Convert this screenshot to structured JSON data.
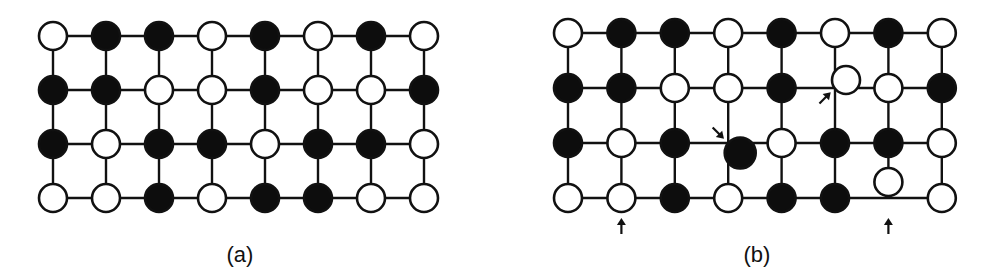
{
  "figure": {
    "colors": {
      "black_node": "#0d0d0d",
      "white_node": "#ffffff",
      "stroke": "#111111"
    },
    "panels": [
      {
        "id": "a",
        "label": "(a)",
        "rows": [
          [
            "W",
            "B",
            "B",
            "W",
            "B",
            "W",
            "B",
            "W"
          ],
          [
            "B",
            "B",
            "W",
            "W",
            "B",
            "W",
            "W",
            "B"
          ],
          [
            "B",
            "W",
            "B",
            "B",
            "W",
            "B",
            "B",
            "W"
          ],
          [
            "W",
            "W",
            "B",
            "W",
            "B",
            "B",
            "W",
            "W"
          ]
        ],
        "defects": [],
        "arrows": []
      },
      {
        "id": "b",
        "label": "(b)",
        "rows": [
          [
            "W",
            "B",
            "B",
            "W",
            "B",
            "W",
            "B",
            "W"
          ],
          [
            "B",
            "B",
            "W",
            "W",
            "B",
            "W",
            "W",
            "B"
          ],
          [
            "B",
            "W",
            "B",
            "B",
            "W",
            "B",
            "B",
            "W"
          ],
          [
            "W",
            "W",
            "B",
            "W",
            "B",
            "B",
            "W",
            "W"
          ]
        ],
        "defects": [
          {
            "row": 1,
            "col": 5,
            "shift": "up-right",
            "description": "displaced white node"
          },
          {
            "row": 2,
            "col": 3,
            "shift": "down-right",
            "description": "displaced black node"
          },
          {
            "row": 3,
            "col": 6,
            "shift": "up",
            "description": "displaced white node"
          }
        ],
        "arrows": [
          {
            "target_row": 3,
            "target_col": 1,
            "direction": "up"
          },
          {
            "target_row": 2,
            "target_col": 3,
            "direction": "down-right"
          },
          {
            "target_row": 1,
            "target_col": 5,
            "direction": "up-right"
          },
          {
            "target_row": 3,
            "target_col": 6,
            "direction": "up"
          }
        ]
      }
    ]
  }
}
